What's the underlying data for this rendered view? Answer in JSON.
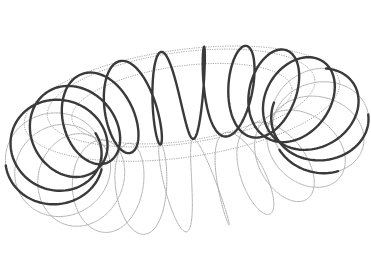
{
  "scene": {
    "subject": "toroidal helix (coil wound around a torus)",
    "background": "#ffffff",
    "width": 371,
    "height": 271
  },
  "torus": {
    "center_x": 187,
    "center_y": 140,
    "major_radius": 135,
    "minor_radius": 48,
    "tilt_deg": 62,
    "rotation_deg": -8,
    "scale_x": 1.0,
    "scale_y": 1.0
  },
  "helix": {
    "turns": 22,
    "samples": 2400,
    "front_color": "#3a3a3a",
    "back_color": "#b0b0b0",
    "front_width": 2.4,
    "back_width": 1.0
  },
  "guides": {
    "count": 3,
    "minor_angles_deg": [
      60,
      120,
      90
    ],
    "color": "#9a9a9a",
    "width": 0.9,
    "dash": "1.2 1.2"
  }
}
